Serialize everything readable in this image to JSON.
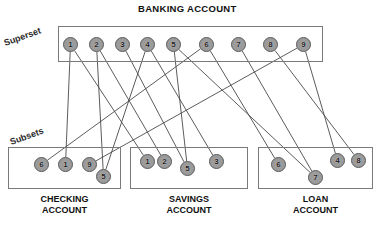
{
  "diagram": {
    "title": "BANKING ACCOUNT",
    "superset_label": "Superset",
    "subsets_label": "Subsets",
    "superset": {
      "name": "BANKING ACCOUNT",
      "box": {
        "x": 58,
        "y": 26,
        "w": 265,
        "h": 36
      },
      "nodes": [
        {
          "id": "s1",
          "label": "1",
          "x": 63,
          "y": 37
        },
        {
          "id": "s2",
          "label": "2",
          "x": 89,
          "y": 37
        },
        {
          "id": "s3",
          "label": "3",
          "x": 115,
          "y": 37
        },
        {
          "id": "s4",
          "label": "4",
          "x": 140,
          "y": 37
        },
        {
          "id": "s5",
          "label": "5",
          "x": 166,
          "y": 37
        },
        {
          "id": "s6",
          "label": "6",
          "x": 199,
          "y": 37
        },
        {
          "id": "s7",
          "label": "7",
          "x": 231,
          "y": 37
        },
        {
          "id": "s8",
          "label": "8",
          "x": 263,
          "y": 37
        },
        {
          "id": "s9",
          "label": "9",
          "x": 296,
          "y": 37
        }
      ]
    },
    "subsets": [
      {
        "key": "checking",
        "caption_line1": "CHECKING",
        "caption_line2": "ACCOUNT",
        "box": {
          "x": 8,
          "y": 147,
          "w": 113,
          "h": 42
        },
        "caption": {
          "x": 8,
          "w": 113,
          "y": 194
        },
        "nodes": [
          {
            "id": "c6",
            "label": "6",
            "x": 34,
            "y": 157
          },
          {
            "id": "c1",
            "label": "1",
            "x": 58,
            "y": 157
          },
          {
            "id": "c9",
            "label": "9",
            "x": 82,
            "y": 157
          },
          {
            "id": "c5",
            "label": "5",
            "x": 96,
            "y": 169
          }
        ]
      },
      {
        "key": "savings",
        "caption_line1": "SAVINGS",
        "caption_line2": "ACCOUNT",
        "box": {
          "x": 130,
          "y": 147,
          "w": 118,
          "h": 42
        },
        "caption": {
          "x": 130,
          "w": 118,
          "y": 194
        },
        "nodes": [
          {
            "id": "v1",
            "label": "1",
            "x": 140,
            "y": 154
          },
          {
            "id": "v2",
            "label": "2",
            "x": 157,
            "y": 154
          },
          {
            "id": "v5",
            "label": "5",
            "x": 180,
            "y": 161
          },
          {
            "id": "v3",
            "label": "3",
            "x": 209,
            "y": 154
          }
        ]
      },
      {
        "key": "loan",
        "caption_line1": "LOAN",
        "caption_line2": "ACCOUNT",
        "box": {
          "x": 258,
          "y": 147,
          "w": 115,
          "h": 42
        },
        "caption": {
          "x": 258,
          "w": 115,
          "y": 194
        },
        "nodes": [
          {
            "id": "l6",
            "label": "6",
            "x": 271,
            "y": 157
          },
          {
            "id": "l7",
            "label": "7",
            "x": 308,
            "y": 170
          },
          {
            "id": "l4",
            "label": "4",
            "x": 330,
            "y": 153
          },
          {
            "id": "l8",
            "label": "8",
            "x": 351,
            "y": 153
          }
        ]
      }
    ],
    "edges": [
      {
        "from": "s1",
        "to": "c1"
      },
      {
        "from": "s1",
        "to": "v1"
      },
      {
        "from": "s2",
        "to": "v2"
      },
      {
        "from": "s2",
        "to": "c5"
      },
      {
        "from": "s3",
        "to": "v5"
      },
      {
        "from": "s4",
        "to": "c5"
      },
      {
        "from": "s5",
        "to": "v5"
      },
      {
        "from": "s5",
        "to": "l7"
      },
      {
        "from": "s6",
        "to": "c6"
      },
      {
        "from": "s6",
        "to": "l6"
      },
      {
        "from": "s7",
        "to": "l7"
      },
      {
        "from": "s8",
        "to": "l8"
      },
      {
        "from": "s9",
        "to": "c9"
      },
      {
        "from": "s4",
        "to": "v3"
      },
      {
        "from": "s9",
        "to": "l4"
      }
    ],
    "colors": {
      "node_fill": "#9b9b9b",
      "node_stroke": "#5a5a5a",
      "box_stroke": "#7a7a7a",
      "line": "#4a4a4a",
      "text": "#111111",
      "background": "#ffffff"
    }
  }
}
